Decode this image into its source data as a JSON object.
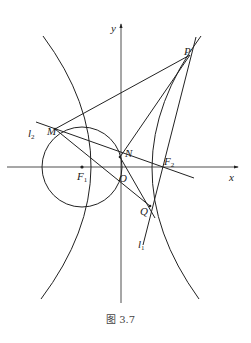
{
  "figure": {
    "caption": "图 3.7",
    "stroke_color": "#222222",
    "axes": {
      "x_label": "x",
      "y_label": "y",
      "origin_label": "O"
    },
    "points": {
      "P": "P",
      "M": "M",
      "N": "N",
      "Q": "Q",
      "F1": {
        "main": "F",
        "sub": "1"
      },
      "F2": {
        "main": "F",
        "sub": "2"
      }
    },
    "lines": {
      "l1": {
        "main": "l",
        "sub": "1"
      },
      "l2": {
        "main": "l",
        "sub": "2"
      }
    },
    "shapes": [
      "hyperbola-left-branch",
      "hyperbola-right-branch",
      "circle-centered-F1"
    ]
  }
}
